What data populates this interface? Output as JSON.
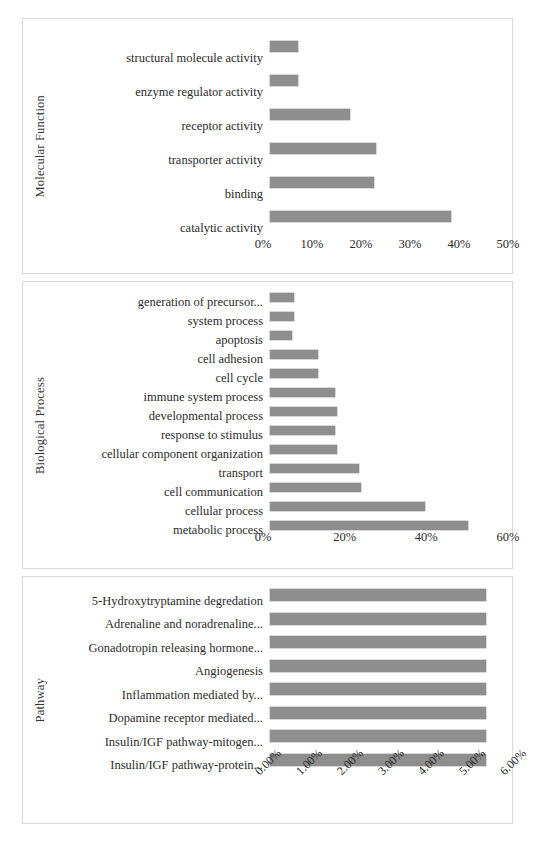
{
  "chart_data": [
    {
      "type": "bar",
      "orientation": "horizontal",
      "title": "",
      "ylabel": "Molecular Function",
      "xlabel": "",
      "categories": [
        "structural molecule activity",
        "enzyme regulator activity",
        "receptor activity",
        "transporter activity",
        "binding",
        "catalytic activity"
      ],
      "values": [
        5.8,
        5.8,
        16.8,
        22.2,
        21.8,
        38.0
      ],
      "xlim": [
        0,
        50
      ],
      "xticks": [
        0,
        10,
        20,
        30,
        40,
        50
      ],
      "xticklabels": [
        "0%",
        "10%",
        "20%",
        "30%",
        "40%",
        "50%"
      ],
      "grid": false,
      "legend": false,
      "bar_color": "#8e8e8e"
    },
    {
      "type": "bar",
      "orientation": "horizontal",
      "title": "",
      "ylabel": "Biological Process",
      "xlabel": "",
      "categories": [
        "generation of precursor...",
        "system process",
        "apoptosis",
        "cell adhesion",
        "cell cycle",
        "immune system process",
        "developmental process",
        "response to stimulus",
        "cellular component organization",
        "transport",
        "cell communication",
        "cellular process",
        "metabolic process"
      ],
      "values": [
        6.0,
        6.0,
        5.6,
        12.0,
        12.0,
        16.5,
        17.0,
        16.5,
        17.0,
        22.5,
        23.0,
        39.0,
        50.0
      ],
      "xlim": [
        0,
        60
      ],
      "xticks": [
        0,
        20,
        40,
        60
      ],
      "xticklabels": [
        "0%",
        "20%",
        "40%",
        "60%"
      ],
      "grid": false,
      "legend": false,
      "bar_color": "#8e8e8e"
    },
    {
      "type": "bar",
      "orientation": "horizontal",
      "title": "",
      "ylabel": "Pathway",
      "xlabel": "",
      "categories": [
        "5-Hydroxytryptamine degredation",
        "Adrenaline and noradrenaline...",
        "Gonadotropin releasing hormone...",
        "Angiogenesis",
        "Inflammation mediated by...",
        "Dopamine receptor mediated...",
        "Insulin/IGF pathway-mitogen...",
        "Insulin/IGF pathway-protein..."
      ],
      "values": [
        5.45,
        5.45,
        5.45,
        5.45,
        5.45,
        5.45,
        5.45,
        5.45
      ],
      "xlim": [
        0,
        6
      ],
      "xticks": [
        0,
        1,
        2,
        3,
        4,
        5,
        6
      ],
      "xticklabels": [
        "0.00%",
        "1.00%",
        "2.00%",
        "3.00%",
        "4.00%",
        "5.00%",
        "6.00%"
      ],
      "grid": false,
      "legend": false,
      "bar_color": "#8e8e8e"
    }
  ]
}
